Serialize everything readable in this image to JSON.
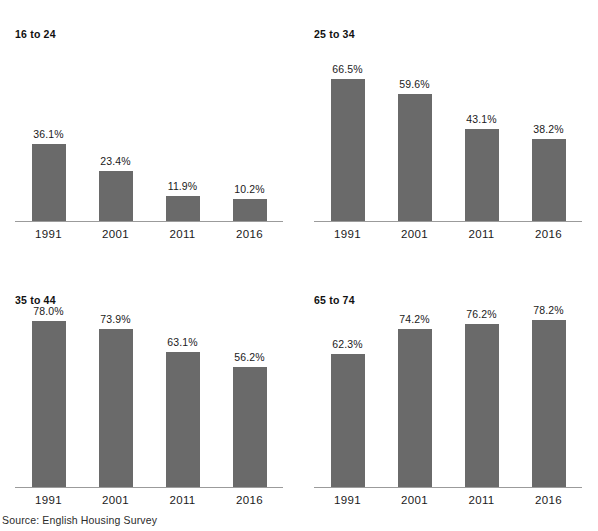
{
  "source_note": "Source: English Housing Survey",
  "top_clipped_text": "",
  "colors": {
    "bar": "#6a6a6a",
    "axis": "#9b9b9b",
    "text": "#1a1a1a"
  },
  "chart_data": [
    {
      "type": "bar",
      "title": "16 to 24",
      "categories": [
        "1991",
        "2001",
        "2011",
        "2016"
      ],
      "values": [
        36.1,
        23.4,
        11.9,
        10.2
      ],
      "labels": [
        "36.1%",
        "23.4%",
        "11.9%",
        "10.2%"
      ],
      "xlabel": "",
      "ylabel": "",
      "ylim": [
        0,
        82
      ],
      "grid": false,
      "legend": "none"
    },
    {
      "type": "bar",
      "title": "25 to 34",
      "categories": [
        "1991",
        "2001",
        "2011",
        "2016"
      ],
      "values": [
        66.5,
        59.6,
        43.1,
        38.2
      ],
      "labels": [
        "66.5%",
        "59.6%",
        "43.1%",
        "38.2%"
      ],
      "xlabel": "",
      "ylabel": "",
      "ylim": [
        0,
        82
      ],
      "grid": false,
      "legend": "none"
    },
    {
      "type": "bar",
      "title": "35 to 44",
      "categories": [
        "1991",
        "2001",
        "2011",
        "2016"
      ],
      "values": [
        78.0,
        73.9,
        63.1,
        56.2
      ],
      "labels": [
        "78.0%",
        "73.9%",
        "63.1%",
        "56.2%"
      ],
      "xlabel": "",
      "ylabel": "",
      "ylim": [
        0,
        82
      ],
      "grid": false,
      "legend": "none"
    },
    {
      "type": "bar",
      "title": "65 to 74",
      "categories": [
        "1991",
        "2001",
        "2011",
        "2016"
      ],
      "values": [
        62.3,
        74.2,
        76.2,
        78.2
      ],
      "labels": [
        "62.3%",
        "74.2%",
        "76.2%",
        "78.2%"
      ],
      "xlabel": "",
      "ylabel": "",
      "ylim": [
        0,
        82
      ],
      "grid": false,
      "legend": "none"
    }
  ]
}
